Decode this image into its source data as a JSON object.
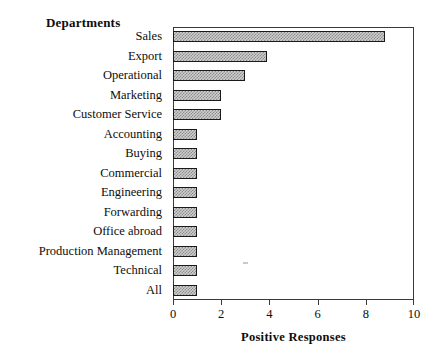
{
  "chart_data": {
    "type": "bar",
    "orientation": "horizontal",
    "title": "",
    "xlabel": "Positive Responses",
    "ylabel": "Departments",
    "xlim": [
      0,
      10
    ],
    "xticks": [
      0,
      2,
      4,
      6,
      8,
      10
    ],
    "xtick_labels": [
      "0",
      "2",
      "4",
      "6",
      "8",
      "10"
    ],
    "grid": false,
    "legend": null,
    "bar_fill": "#cfcfcf",
    "bar_pattern": "checkerboard-dither",
    "bar_border": "#1a1a1a",
    "axis_color": "#3a3a3a",
    "categories": [
      "Sales",
      "Export",
      "Operational",
      "Marketing",
      "Customer Service",
      "Accounting",
      "Buying",
      "Commercial",
      "Engineering",
      "Forwarding",
      "Office abroad",
      "Production Management",
      "Technical",
      "All"
    ],
    "values": [
      8.8,
      3.9,
      3.0,
      2.0,
      2.0,
      1.0,
      1.0,
      1.0,
      1.0,
      1.0,
      1.0,
      1.0,
      1.0,
      1.0
    ]
  }
}
